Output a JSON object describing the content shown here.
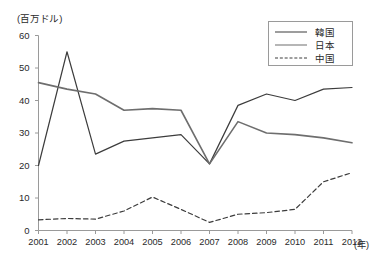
{
  "chart_data": {
    "type": "line",
    "title": "",
    "xlabel": "(年)",
    "ylabel": "(百万ドル)",
    "x": [
      2001,
      2002,
      2003,
      2004,
      2005,
      2006,
      2007,
      2008,
      2009,
      2010,
      2011,
      2012
    ],
    "categories": [
      "2001",
      "2002",
      "2003",
      "2004",
      "2005",
      "2006",
      "2007",
      "2008",
      "2009",
      "2010",
      "2011",
      "2012"
    ],
    "xlim": [
      2001,
      2012
    ],
    "ylim": [
      0,
      60
    ],
    "yticks": [
      0,
      10,
      20,
      30,
      40,
      50,
      60
    ],
    "ytick_labels": [
      "0",
      "10",
      "20",
      "30",
      "40",
      "50",
      "60"
    ],
    "grid": false,
    "legend_position": "top-right",
    "series": [
      {
        "name": "韓国",
        "style": "solid",
        "color": "#3c3c3c",
        "width": 1.2,
        "values": [
          20,
          55,
          23.5,
          27.5,
          28.5,
          29.5,
          20.5,
          38.5,
          42,
          40,
          43.5,
          44
        ]
      },
      {
        "name": "日本",
        "style": "solid",
        "color": "#6e6e6e",
        "width": 1.6,
        "values": [
          45.5,
          43.5,
          42,
          37,
          37.5,
          37,
          20.5,
          33.5,
          30,
          29.5,
          28.5,
          27
        ]
      },
      {
        "name": "中国",
        "style": "dashed",
        "color": "#3c3c3c",
        "width": 1.2,
        "values": [
          3.3,
          3.7,
          3.5,
          6,
          10.3,
          6.5,
          2.5,
          5,
          5.5,
          6.5,
          15,
          17.8
        ]
      }
    ]
  },
  "axes": {
    "unit_label": "(百万ドル)",
    "x_unit_label": "(年)"
  },
  "legend": {
    "entries": [
      {
        "label": "韓国"
      },
      {
        "label": "日本"
      },
      {
        "label": "中国"
      }
    ]
  },
  "colors": {
    "axis": "#9a9a9a",
    "text": "#2a2a2a",
    "korea": "#3c3c3c",
    "japan": "#6e6e6e",
    "china": "#3c3c3c",
    "background": "#ffffff"
  }
}
